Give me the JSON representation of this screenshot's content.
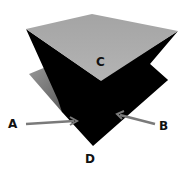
{
  "diagram": {
    "labels": {
      "a": "A",
      "b": "B",
      "c": "C",
      "d": "D"
    },
    "colors": {
      "top_face": "#a9a9a9",
      "lower_sheet": "#8a8a8a",
      "dark_body": "#000000",
      "arrow": "#7a7a7a",
      "background": "#ffffff"
    }
  }
}
